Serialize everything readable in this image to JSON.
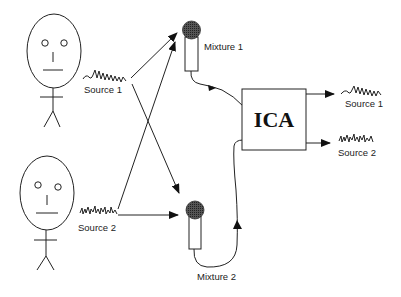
{
  "diagram": {
    "speakers": [
      {
        "id": "speaker-1",
        "signal_label": "Source 1"
      },
      {
        "id": "speaker-2",
        "signal_label": "Source 2"
      }
    ],
    "microphones": [
      {
        "id": "mic-1",
        "label": "Mixture 1"
      },
      {
        "id": "mic-2",
        "label": "Mixture 2"
      }
    ],
    "processor": {
      "label": "ICA"
    },
    "outputs": [
      {
        "label": "Source 1"
      },
      {
        "label": "Source 2"
      }
    ],
    "colors": {
      "line": "#222222",
      "mic_head": "#444444",
      "background": "#ffffff"
    }
  }
}
